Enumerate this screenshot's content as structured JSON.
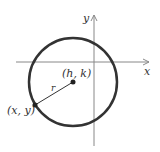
{
  "diagram": {
    "labels": {
      "x_axis": "x",
      "y_axis": "y",
      "center": "(h, k)",
      "radius": "r",
      "point": "(x, y)"
    },
    "colors": {
      "circle": "#333333",
      "axes": "#888888",
      "text": "#333333"
    }
  }
}
